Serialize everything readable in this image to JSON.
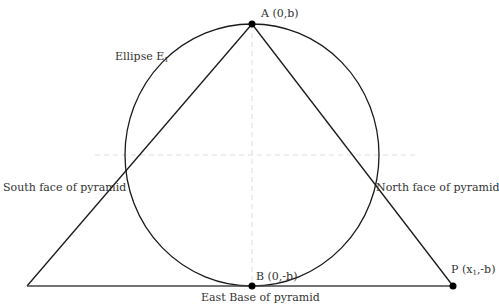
{
  "diagram": {
    "labels": {
      "apex": "A (0,b)",
      "ellipse": "Ellipse E",
      "ellipse_sub": "1",
      "south_face": "South face of pyramid",
      "north_face": "North face of pyramid",
      "bottom_point": "B (0,-b)",
      "east_base": "East Base of pyramid",
      "point_p_prefix": "P (x",
      "point_p_sub": "1",
      "point_p_suffix": ",-b)"
    },
    "colors": {
      "line": "#1a1a1a",
      "axis": "#dddddd",
      "text": "#333333"
    }
  }
}
